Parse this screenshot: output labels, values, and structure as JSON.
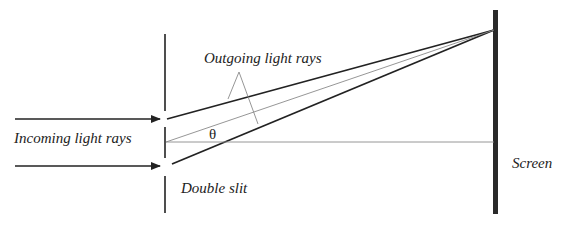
{
  "diagram": {
    "labels": {
      "incoming": "Incoming light rays",
      "outgoing": "Outgoing light rays",
      "double_slit": "Double slit",
      "screen": "Screen",
      "angle": "θ"
    },
    "colors": {
      "ink": "#222222",
      "thin_line": "#8a8a8a",
      "screen": "#2a2a2a",
      "background": "#ffffff"
    }
  }
}
